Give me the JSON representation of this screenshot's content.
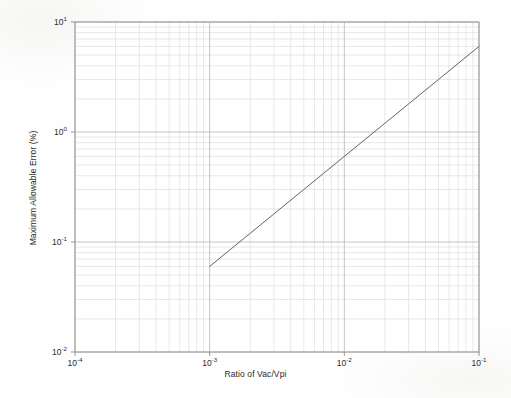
{
  "figure": {
    "background_color": "#fefefe",
    "plot_frame_color": "#9a9a9a",
    "major_grid_color": "#b9b9bd",
    "minor_grid_color": "#dedee2",
    "line_color": "#5a5a62"
  },
  "axes": {
    "x_label": "Ratio of Vac/Vpi",
    "y_label": "Maximum Allowable Error (%)",
    "x_ticks": [
      {
        "mantissa": "10",
        "exponent": "-4",
        "value": 0.0001
      },
      {
        "mantissa": "10",
        "exponent": "-3",
        "value": 0.001
      },
      {
        "mantissa": "10",
        "exponent": "-2",
        "value": 0.01
      },
      {
        "mantissa": "10",
        "exponent": "-1",
        "value": 0.1
      }
    ],
    "y_ticks": [
      {
        "mantissa": "10",
        "exponent": "1",
        "value": 10
      },
      {
        "mantissa": "10",
        "exponent": "0",
        "value": 1
      },
      {
        "mantissa": "10",
        "exponent": "-1",
        "value": 0.1
      },
      {
        "mantissa": "10",
        "exponent": "-2",
        "value": 0.01
      }
    ]
  },
  "chart_data": {
    "type": "line",
    "title": "",
    "xlabel": "Ratio of Vac/Vpi",
    "ylabel": "Maximum Allowable Error (%)",
    "xscale": "log",
    "yscale": "log",
    "xlim": [
      0.0001,
      0.1
    ],
    "ylim": [
      0.01,
      10
    ],
    "grid": true,
    "minor_grid": true,
    "legend": null,
    "series": [
      {
        "name": "Maximum Allowable Error",
        "x": [
          0.001,
          0.002,
          0.003,
          0.005,
          0.007,
          0.01,
          0.02,
          0.03,
          0.05,
          0.07,
          0.1
        ],
        "y": [
          0.06,
          0.12,
          0.18,
          0.3,
          0.42,
          0.6,
          1.2,
          1.8,
          3.0,
          4.2,
          6.0
        ]
      }
    ],
    "annotations": []
  }
}
